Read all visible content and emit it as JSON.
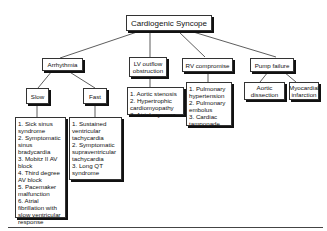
{
  "diagram": {
    "root": "Cardiogenic Syncope",
    "categories": [
      {
        "label": "Arrhythmia"
      },
      {
        "label": "LV outflow obstruction"
      },
      {
        "label": "RV compromise"
      },
      {
        "label": "Pump failure"
      }
    ],
    "arrhythmia": {
      "slow": {
        "label": "Slow",
        "items": [
          "1. Sick sinus syndrome",
          "2. Symptomatic sinus bradycardia",
          "3. Mobitz II AV block",
          "4. Third degree AV block",
          "5. Pacemaker malfunction",
          "6. Atrial fibrillation with slow ventricular response"
        ]
      },
      "fast": {
        "label": "Fast",
        "items": [
          "1. Sustained ventricular tachycardia",
          "2. Symptomatic supraventricular tachycardia",
          "3. Long QT syndrome"
        ]
      }
    },
    "lv_outflow": {
      "items": [
        "1. Aortic stenosis",
        "2. Hypertrophic cardiomyopathy",
        "3. Atrial myxoma"
      ]
    },
    "rv_compromise": {
      "items": [
        "1. Pulmonary hypertension",
        "2. Pulmonary embolus",
        "3. Cardiac tamponade"
      ]
    },
    "pump_failure": {
      "children": [
        {
          "label": "Aortic dissection"
        },
        {
          "label": "Myocardial infarction"
        }
      ]
    }
  }
}
